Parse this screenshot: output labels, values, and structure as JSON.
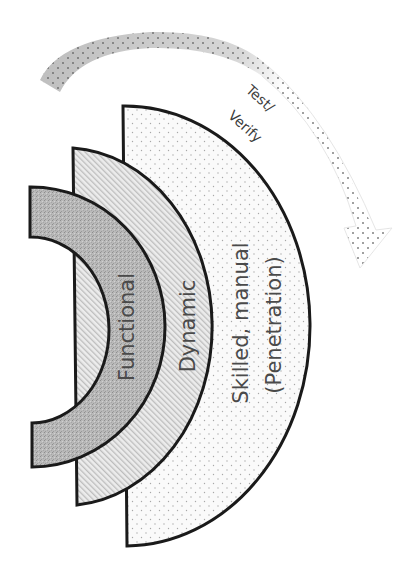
{
  "diagram": {
    "type": "nested-semicircle-layers",
    "layers": [
      {
        "id": "functional",
        "label": "Functional",
        "fill": "#b8b8b8",
        "pattern": "speckle"
      },
      {
        "id": "dynamic",
        "label": "Dynamic",
        "fill": "#e2e2e2",
        "pattern": "diagonal-hatch"
      },
      {
        "id": "skilled",
        "label_line1": "Skilled, manual",
        "label_line2": "(Penetration)",
        "fill": "#f7f7f7",
        "pattern": "dots"
      }
    ],
    "arrow": {
      "label_line1": "Test/",
      "label_line2": "Verify",
      "direction": "clockwise",
      "fill_start": "#bdbdbd",
      "fill_end": "#ffffff"
    },
    "colors": {
      "outline": "#1a1a1a",
      "text": "#4a4a4a",
      "background": "#ffffff"
    }
  }
}
